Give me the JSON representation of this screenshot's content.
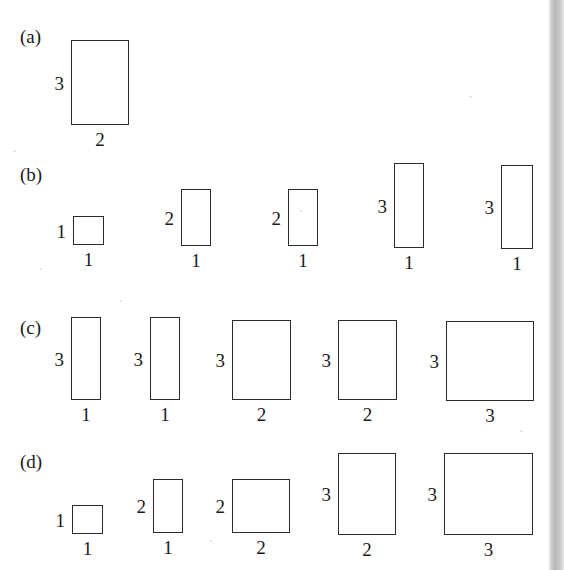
{
  "figure": {
    "width": 564,
    "height": 570,
    "background": "#ffffff",
    "stroke_color": "#2a2a2a",
    "text_color": "#1a1a1a"
  },
  "right_strip": {
    "name": "page-edge-shadow",
    "x": 548,
    "width": 16,
    "height": 570,
    "color": "#b8b8b8"
  },
  "rows": [
    {
      "tag": "(a)",
      "tag_x": 20,
      "tag_y": 27,
      "items": [
        {
          "left_label": "3",
          "bottom_label": "2",
          "x": 71,
          "y": 40,
          "w": 58,
          "h": 85
        }
      ]
    },
    {
      "tag": "(b)",
      "tag_x": 20,
      "tag_y": 165,
      "items": [
        {
          "left_label": "1",
          "bottom_label": "1",
          "x": 73,
          "y": 216,
          "w": 31,
          "h": 29
        },
        {
          "left_label": "2",
          "bottom_label": "1",
          "x": 181,
          "y": 189,
          "w": 30,
          "h": 57
        },
        {
          "left_label": "2",
          "bottom_label": "1",
          "x": 288,
          "y": 189,
          "w": 30,
          "h": 57
        },
        {
          "left_label": "3",
          "bottom_label": "1",
          "x": 394,
          "y": 163,
          "w": 30,
          "h": 85
        },
        {
          "left_label": "3",
          "bottom_label": "1",
          "x": 501,
          "y": 165,
          "w": 32,
          "h": 84
        }
      ]
    },
    {
      "tag": "(c)",
      "tag_x": 20,
      "tag_y": 318,
      "items": [
        {
          "left_label": "3",
          "bottom_label": "1",
          "x": 71,
          "y": 317,
          "w": 30,
          "h": 83
        },
        {
          "left_label": "3",
          "bottom_label": "1",
          "x": 150,
          "y": 317,
          "w": 30,
          "h": 83
        },
        {
          "left_label": "3",
          "bottom_label": "2",
          "x": 232,
          "y": 320,
          "w": 59,
          "h": 80
        },
        {
          "left_label": "3",
          "bottom_label": "2",
          "x": 338,
          "y": 320,
          "w": 59,
          "h": 80
        },
        {
          "left_label": "3",
          "bottom_label": "3",
          "x": 446,
          "y": 321,
          "w": 88,
          "h": 80
        }
      ]
    },
    {
      "tag": "(d)",
      "tag_x": 20,
      "tag_y": 452,
      "items": [
        {
          "left_label": "1",
          "bottom_label": "1",
          "x": 72,
          "y": 505,
          "w": 31,
          "h": 29
        },
        {
          "left_label": "2",
          "bottom_label": "1",
          "x": 153,
          "y": 479,
          "w": 30,
          "h": 54
        },
        {
          "left_label": "2",
          "bottom_label": "2",
          "x": 232,
          "y": 479,
          "w": 58,
          "h": 54
        },
        {
          "left_label": "3",
          "bottom_label": "2",
          "x": 338,
          "y": 453,
          "w": 58,
          "h": 82
        },
        {
          "left_label": "3",
          "bottom_label": "3",
          "x": 444,
          "y": 453,
          "w": 89,
          "h": 82
        }
      ]
    }
  ]
}
